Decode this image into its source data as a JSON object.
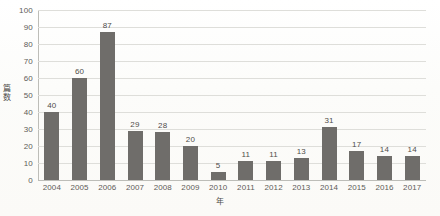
{
  "chart_data": {
    "type": "bar",
    "title": "",
    "xlabel": "年",
    "ylabel": "篇数",
    "categories": [
      "2004",
      "2005",
      "2006",
      "2007",
      "2008",
      "2009",
      "2010",
      "2011",
      "2012",
      "2013",
      "2014",
      "2015",
      "2016",
      "2017"
    ],
    "values": [
      40,
      60,
      87,
      29,
      28,
      20,
      5,
      11,
      11,
      13,
      31,
      17,
      14,
      14
    ],
    "data_labels": [
      "40",
      "60",
      "87",
      "29",
      "28",
      "20",
      "5",
      "11",
      "11",
      "13",
      "31",
      "17",
      "14",
      "14"
    ],
    "ylim": [
      0,
      100
    ],
    "ytick_labels": [
      "100",
      "90",
      "80",
      "70",
      "60",
      "50",
      "40",
      "30",
      "20",
      "10",
      "0"
    ],
    "ytick_values": [
      100,
      90,
      80,
      70,
      60,
      50,
      40,
      30,
      20,
      10,
      0
    ],
    "grid": true,
    "grid_axis": "y",
    "legend": false,
    "legend_position": "none",
    "series": [
      {
        "name": "篇数",
        "values": [
          40,
          60,
          87,
          29,
          28,
          20,
          5,
          11,
          11,
          13,
          31,
          17,
          14,
          14
        ]
      }
    ],
    "colors": {
      "bar": "#6f6d6a",
      "gridline": "#dededa",
      "axis": "#bdbdb8",
      "text": "#4f4d4a",
      "background": "#fdfdfb"
    }
  }
}
